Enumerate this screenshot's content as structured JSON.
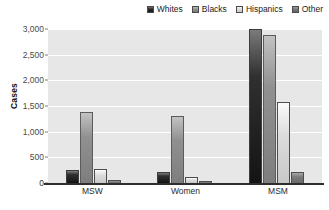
{
  "chart_data": {
    "type": "bar",
    "title": "",
    "xlabel": "",
    "ylabel": "Cases",
    "ylim": [
      0,
      3000
    ],
    "yticks": [
      "0",
      "500",
      "1,000",
      "1,500",
      "2,000",
      "2,500",
      "3,000"
    ],
    "grid": true,
    "legend_position": "top-right",
    "categories": [
      "MSW",
      "Women",
      "MSM"
    ],
    "series": [
      {
        "name": "Whites",
        "values": [
          250,
          220,
          3000
        ],
        "color": "#1e1e1e"
      },
      {
        "name": "Blacks",
        "values": [
          1380,
          1300,
          2880
        ],
        "color": "#8b8b8b"
      },
      {
        "name": "Hispanics",
        "values": [
          275,
          115,
          1570
        ],
        "color": "#d8d8d8"
      },
      {
        "name": "Other",
        "values": [
          55,
          35,
          210
        ],
        "color": "#727272"
      }
    ]
  },
  "legend": {
    "items": [
      {
        "label": "Whites"
      },
      {
        "label": "Blacks"
      },
      {
        "label": "Hispanics"
      },
      {
        "label": "Other"
      }
    ]
  },
  "axes": {
    "y_title": "Cases",
    "y_ticks": [
      {
        "label": "3,000"
      },
      {
        "label": "2,500"
      },
      {
        "label": "2,000"
      },
      {
        "label": "1,500"
      },
      {
        "label": "1,000"
      },
      {
        "label": "500"
      },
      {
        "label": "0"
      }
    ],
    "x_ticks": [
      {
        "label": "MSW"
      },
      {
        "label": "Women"
      },
      {
        "label": "MSM"
      }
    ]
  }
}
